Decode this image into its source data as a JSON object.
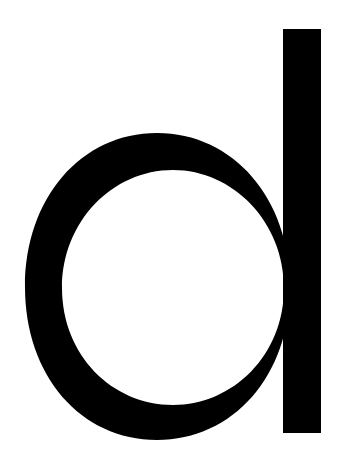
{
  "glyph": {
    "character": "d",
    "color": "#000000",
    "background": "#ffffff"
  }
}
